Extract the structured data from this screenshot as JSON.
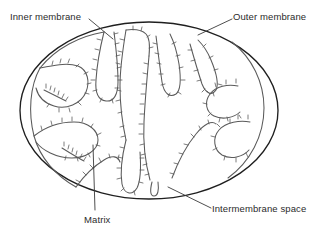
{
  "figure": {
    "style": "line-drawing",
    "background_color": "#ffffff",
    "stroke_color_outer": "#1f1f1f",
    "stroke_color_inner": "#555555",
    "text_color": "#2b2b2b"
  },
  "labels": {
    "inner_membrane": "Inner membrane",
    "outer_membrane": "Outer membrane",
    "matrix": "Matrix",
    "intermembrane_space": "Intermembrane space"
  },
  "structures": {
    "outer_membrane_name": "outer-membrane-ellipse",
    "inner_membrane_name": "inner-membrane-cristae",
    "cristae_count": 11,
    "crista_particles_name": "atp-synthase-particles"
  },
  "leader_lines": [
    {
      "name": "leader-inner-membrane",
      "from": [
        89,
        19
      ],
      "to": [
        113,
        39
      ]
    },
    {
      "name": "leader-outer-membrane",
      "from": [
        232,
        19
      ],
      "to": [
        198,
        35
      ]
    },
    {
      "name": "leader-matrix",
      "from": [
        93,
        145
      ],
      "to": [
        95,
        210
      ]
    },
    {
      "name": "leader-intermembrane-space",
      "from": [
        168,
        187
      ],
      "to": [
        211,
        208
      ]
    }
  ]
}
